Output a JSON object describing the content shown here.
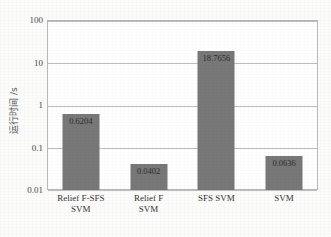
{
  "chart_data": {
    "type": "bar",
    "title": "",
    "subtitle": "",
    "xlabel": "",
    "ylabel": "运行时间 /s",
    "yscale": "log",
    "ylim": [
      0.01,
      100
    ],
    "yticks": [
      "100",
      "10",
      "1",
      "0.1",
      "0.01"
    ],
    "ytick_values": [
      100,
      10,
      1,
      0.1,
      0.01
    ],
    "grid": true,
    "legend": null,
    "bar_color": "#787878",
    "plot_background": "#ffffff",
    "axis_color": "#b9b9b9",
    "categories": [
      "Relief F-SFS\nSVM",
      "Relief F\nSVM",
      "SFS SVM",
      "SVM"
    ],
    "category_lines": [
      [
        "Relief F-SFS",
        "SVM"
      ],
      [
        "Relief F",
        "SVM"
      ],
      [
        "SFS SVM",
        ""
      ],
      [
        "SVM",
        ""
      ]
    ],
    "values": [
      0.6204,
      0.0402,
      18.7656,
      0.0636
    ],
    "value_labels": [
      "0.6204",
      "0.0402",
      "18.7656",
      "0.0636"
    ]
  }
}
